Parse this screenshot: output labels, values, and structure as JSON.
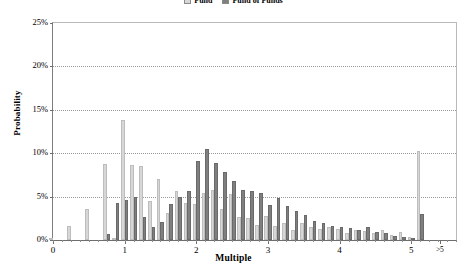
{
  "chart_data": {
    "type": "bar",
    "title": "",
    "xlabel": "Multiple",
    "ylabel": "Probability",
    "ylim": [
      0,
      25
    ],
    "ytick_labels": [
      "0%",
      "5%",
      "10%",
      "15%",
      "20%",
      "25%"
    ],
    "ytick_values": [
      0,
      5,
      10,
      15,
      20,
      25
    ],
    "xtick_labels": [
      "0",
      "1",
      "2",
      "3",
      "4",
      "5",
      ">5"
    ],
    "xtick_values": [
      0,
      1,
      2,
      3,
      4,
      5,
      5.4
    ],
    "grid": true,
    "legend_position": "top-center",
    "categories": [
      "0",
      "0.125",
      "0.25",
      "0.375",
      "0.5",
      "0.625",
      "0.75",
      "0.875",
      "1",
      "1.125",
      "1.25",
      "1.375",
      "1.5",
      "1.625",
      "1.75",
      "1.875",
      "2",
      "2.125",
      "2.25",
      "2.375",
      "2.5",
      "2.625",
      "2.75",
      "2.875",
      "3",
      "3.125",
      "3.25",
      "3.375",
      "3.5",
      "3.625",
      "3.75",
      "3.875",
      "4",
      "4.125",
      "4.25",
      "4.375",
      "4.5",
      "4.625",
      "4.75",
      "4.875",
      "5",
      ">5"
    ],
    "series": [
      {
        "name": "Fund",
        "color": "#d7d7d7",
        "values": [
          0.2,
          0.0,
          1.6,
          0.0,
          3.6,
          0.0,
          8.8,
          0.2,
          13.8,
          8.6,
          8.5,
          4.5,
          7.0,
          3.1,
          5.6,
          4.3,
          4.1,
          5.4,
          5.8,
          3.6,
          5.3,
          2.6,
          2.5,
          1.7,
          2.8,
          1.6,
          2.0,
          1.1,
          2.0,
          1.5,
          1.3,
          1.5,
          1.3,
          0.8,
          1.1,
          1.0,
          0.8,
          1.2,
          0.6,
          0.9,
          0.4,
          10.3
        ]
      },
      {
        "name": "Fund of Funds",
        "color": "#7f7f7f",
        "values": [
          0.0,
          0.0,
          0.0,
          0.0,
          0.0,
          0.0,
          0.7,
          4.3,
          4.6,
          5.0,
          2.7,
          1.5,
          2.1,
          4.2,
          5.0,
          5.7,
          9.1,
          10.5,
          8.9,
          7.8,
          6.8,
          5.8,
          5.6,
          5.4,
          4.0,
          4.8,
          3.9,
          3.3,
          2.9,
          2.2,
          2.0,
          1.6,
          1.5,
          1.4,
          1.1,
          1.5,
          0.9,
          0.8,
          0.5,
          0.3,
          0.2,
          3.0
        ]
      }
    ]
  },
  "legend": {
    "entries": [
      {
        "label": "Fund",
        "color": "#d7d7d7"
      },
      {
        "label": "Fund of Funds",
        "color": "#7f7f7f"
      }
    ]
  },
  "axes": {
    "y_title": "Probability",
    "x_title": "Multiple"
  }
}
